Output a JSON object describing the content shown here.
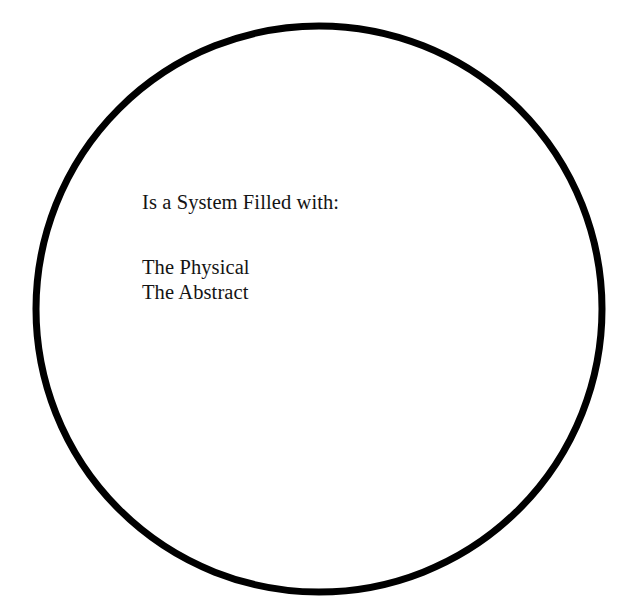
{
  "canvas": {
    "width": 640,
    "height": 616,
    "background_color": "#ffffff"
  },
  "diagram": {
    "type": "venn-single-circle",
    "shape_name": "circle",
    "stroke_color": "#000000",
    "stroke_width": 7,
    "fill_color": "none",
    "center_x": 319,
    "center_y": 309,
    "radius": 283
  },
  "text": {
    "color": "#141414",
    "heading": "Is a System Filled with:",
    "items": [
      "The Physical",
      "The Abstract"
    ]
  }
}
